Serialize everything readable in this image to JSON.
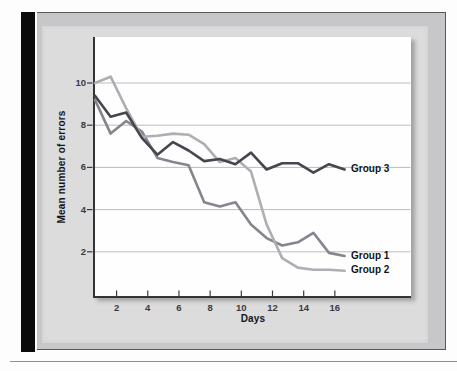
{
  "figure": {
    "kind": "textbook line-graph figure",
    "background": "scanned page with black binding bar and gray framed panel"
  },
  "chart_data": {
    "type": "line",
    "title": "",
    "xlabel": "Days",
    "ylabel": "Mean number of errors",
    "x": [
      1,
      2,
      3,
      4,
      5,
      6,
      7,
      8,
      9,
      10,
      11,
      12,
      13,
      14,
      15,
      16,
      17
    ],
    "x_ticks": [
      2,
      4,
      6,
      8,
      10,
      12,
      14,
      16
    ],
    "y_ticks": [
      2,
      4,
      6,
      8,
      10
    ],
    "xlim": [
      0.5,
      17.5
    ],
    "ylim": [
      0,
      10.5
    ],
    "grid": "horizontal gridlines only",
    "legend_position": "labels at right end of each line",
    "series": [
      {
        "name": "Group 1",
        "color": "#85858d",
        "values": [
          9.2,
          7.6,
          8.2,
          7.7,
          6.45,
          6.25,
          6.1,
          4.35,
          4.15,
          4.35,
          3.3,
          2.65,
          2.3,
          2.45,
          2.9,
          1.95,
          1.8
        ]
      },
      {
        "name": "Group 2",
        "color": "#aeaeb4",
        "values": [
          10.0,
          10.3,
          8.8,
          7.45,
          7.5,
          7.6,
          7.55,
          7.1,
          6.25,
          6.45,
          5.8,
          3.3,
          1.7,
          1.25,
          1.15,
          1.15,
          1.1
        ]
      },
      {
        "name": "Group 3",
        "color": "#46464e",
        "values": [
          9.4,
          8.4,
          8.6,
          7.4,
          6.6,
          7.2,
          6.8,
          6.3,
          6.4,
          6.15,
          6.7,
          5.9,
          6.2,
          6.2,
          5.75,
          6.15,
          5.9
        ]
      }
    ],
    "axis_colors": {
      "axis_line": "#333338",
      "gridline": "#bcbcbe",
      "tick_mark": "#3c3c40",
      "tick_text": "#3a3a3e",
      "label_text": "#141416"
    }
  }
}
